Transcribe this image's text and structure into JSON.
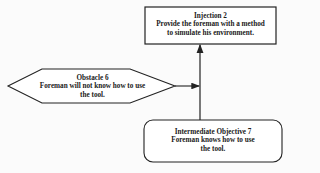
{
  "nodes": {
    "injection": {
      "title": "Injection 2",
      "line1": "Provide the foreman with a method",
      "line2": "to simulate  his environment."
    },
    "obstacle": {
      "title": "Obstacle 6",
      "line1": "Foreman will not know how to use",
      "line2": "the tool."
    },
    "objective": {
      "title": "Intermediate Objective 7",
      "line1": "Foreman knows how to use",
      "line2": "the tool."
    }
  },
  "colors": {
    "stroke": "#222222",
    "background": "#fbfbfb"
  }
}
